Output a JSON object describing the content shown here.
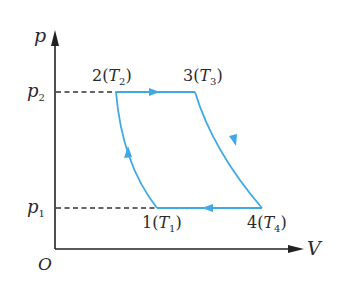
{
  "diagram": {
    "axes": {
      "y_label": "p",
      "x_label": "V",
      "origin_label": "O",
      "y_ticks": [
        {
          "base": "p",
          "sub": "2",
          "level": "high"
        },
        {
          "base": "p",
          "sub": "1",
          "level": "low"
        }
      ]
    },
    "points": [
      {
        "id": "1",
        "text": "1(",
        "T": "T",
        "sub": "1",
        "close": ")"
      },
      {
        "id": "2",
        "text": "2(",
        "T": "T",
        "sub": "2",
        "close": ")"
      },
      {
        "id": "3",
        "text": "3(",
        "T": "T",
        "sub": "3",
        "close": ")"
      },
      {
        "id": "4",
        "text": "4(",
        "T": "T",
        "sub": "4",
        "close": ")"
      }
    ],
    "processes": [
      {
        "from": "1",
        "to": "2",
        "type": "adiabatic compression (curve)",
        "direction": "up"
      },
      {
        "from": "2",
        "to": "3",
        "type": "isobaric at p2",
        "direction": "right"
      },
      {
        "from": "3",
        "to": "4",
        "type": "adiabatic expansion (curve)",
        "direction": "down"
      },
      {
        "from": "4",
        "to": "1",
        "type": "isobaric at p1",
        "direction": "left"
      }
    ],
    "colors": {
      "cycle": "#3fa9e8",
      "axes": "#222222",
      "dashed": "#333333",
      "text": "#2a2a2a"
    }
  }
}
